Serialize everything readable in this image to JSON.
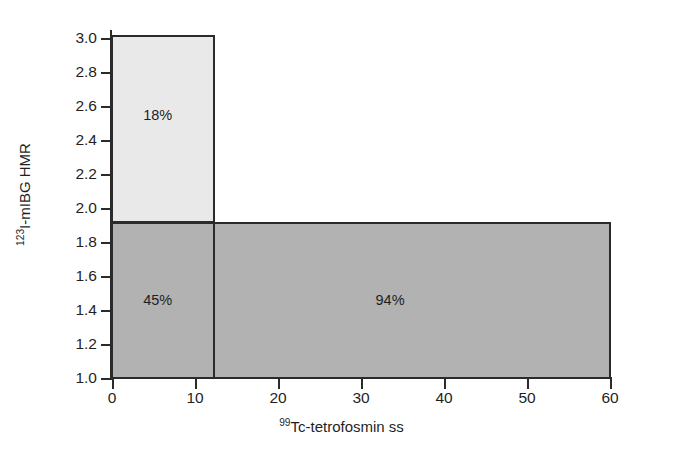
{
  "chart_data": {
    "type": "bar",
    "title": "",
    "xlabel": "99Tc-tetrofosmin ss",
    "ylabel": "123I-mIBG HMR",
    "xlabel_sup": "99",
    "xlabel_rest": "Tc-tetrofosmin ss",
    "ylabel_sup": "123",
    "ylabel_rest": "I-mIBG HMR",
    "xlim": [
      0,
      60
    ],
    "ylim": [
      1.0,
      3.0
    ],
    "xticks": [
      0,
      10,
      20,
      30,
      40,
      50,
      60
    ],
    "xticklabels": [
      "0",
      "10",
      "20",
      "30",
      "40",
      "50",
      "60"
    ],
    "yticks": [
      1.0,
      1.2,
      1.4,
      1.6,
      1.8,
      2.0,
      2.2,
      2.4,
      2.6,
      2.8,
      3.0
    ],
    "yticklabels": [
      "1.0",
      "1.2",
      "1.4",
      "1.6",
      "1.8",
      "2.0",
      "2.2",
      "2.4",
      "2.6",
      "2.8",
      "3.0"
    ],
    "grid": false,
    "legend": "none",
    "regions": [
      {
        "name": "low-ss-high-hmr",
        "label": "18%",
        "x0": 0,
        "x1": 12.3,
        "y0": 1.92,
        "y1": 3.02,
        "fill": "#e9e9e9",
        "stroke": "#2b2b2b",
        "label_x": 5.5,
        "label_y": 2.55
      },
      {
        "name": "low-ss-low-hmr",
        "label": "45%",
        "x0": 0,
        "x1": 12.3,
        "y0": 1.0,
        "y1": 1.92,
        "fill": "#b2b2b2",
        "stroke": "#2b2b2b",
        "label_x": 5.5,
        "label_y": 1.46
      },
      {
        "name": "high-ss-low-hmr",
        "label": "94%",
        "x0": 12.3,
        "x1": 60,
        "y0": 1.0,
        "y1": 1.92,
        "fill": "#b2b2b2",
        "stroke": "#2b2b2b",
        "label_x": 33.5,
        "label_y": 1.46
      }
    ]
  },
  "colors": {
    "background": "#ffffff",
    "axis": "#2b2b2b",
    "text": "#1f1f1f",
    "fill_light": "#e9e9e9",
    "fill_dark": "#b2b2b2"
  }
}
